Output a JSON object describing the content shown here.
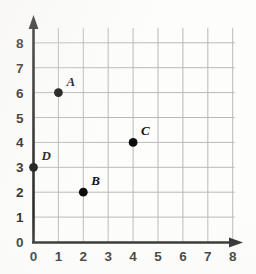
{
  "chart_data": {
    "type": "scatter",
    "title": "",
    "xlabel": "",
    "ylabel": "",
    "xlim": [
      0,
      8
    ],
    "ylim": [
      0,
      8
    ],
    "grid": true,
    "legend": "none",
    "x_ticks": [
      "0",
      "1",
      "2",
      "3",
      "4",
      "5",
      "6",
      "7",
      "8"
    ],
    "y_ticks": [
      "0",
      "1",
      "2",
      "3",
      "4",
      "5",
      "6",
      "7",
      "8"
    ],
    "points": [
      {
        "label": "A",
        "x": 1,
        "y": 6
      },
      {
        "label": "B",
        "x": 2,
        "y": 2
      },
      {
        "label": "C",
        "x": 4,
        "y": 4
      },
      {
        "label": "D",
        "x": 0,
        "y": 3
      }
    ],
    "colors": {
      "point": "#0d0d0d",
      "axis": "#1c1c1c",
      "grid": "#b9b9b9",
      "background": "#fdfdfc",
      "text": "#1a1a1a"
    }
  }
}
